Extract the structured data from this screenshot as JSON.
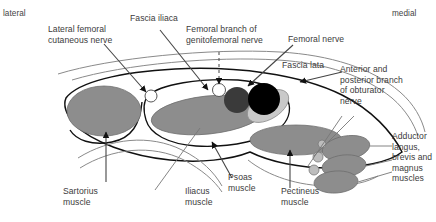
{
  "figure": {
    "type": "anatomical-cross-section",
    "region": "Anterior thigh / femoral triangle transverse section",
    "orientation": {
      "left_label": "lateral",
      "right_label": "medial"
    },
    "labels": {
      "lateral_femoral_cutaneous_nerve": "Lateral femoral\ncutaneous nerve",
      "fascia_iliaca": "Fascia iliaca",
      "femoral_branch_genitofemoral": "Femoral branch of\ngenitofemoral nerve",
      "femoral_nerve": "Femoral nerve",
      "fascia_lata": "Fascia lata",
      "obturator_nerve": "Anterior and\nposterior branch\nof obturator\nnerve",
      "adductor_muscles": "Adductor\nlangus,\nbrevis and\nmagnus\nmuscles",
      "sartorius_muscle": "Sartorius\nmuscle",
      "iliacus_muscle": "Iliacus\nmuscle",
      "psoas_muscle": "Psoas\nmuscle",
      "pectineus_muscle": "Pectineus\nmuscle"
    },
    "structures": [
      {
        "name": "sartorius-muscle",
        "shape": "ellipse",
        "fill": "#8d8d8d"
      },
      {
        "name": "iliacus-muscle",
        "shape": "ellipse",
        "fill": "#8d8d8d"
      },
      {
        "name": "psoas-muscle",
        "shape": "ellipse",
        "fill": "#c9c9c9"
      },
      {
        "name": "pectineus-muscle",
        "shape": "ellipse",
        "fill": "#8d8d8d"
      },
      {
        "name": "femoral-artery",
        "shape": "circle",
        "fill": "#3a3a3a"
      },
      {
        "name": "femoral-vein",
        "shape": "circle",
        "fill": "#000000"
      },
      {
        "name": "adductor-longus-muscle",
        "shape": "ellipse",
        "fill": "#8d8d8d"
      },
      {
        "name": "adductor-brevis-muscle",
        "shape": "ellipse",
        "fill": "#8d8d8d"
      },
      {
        "name": "adductor-magnus-muscle",
        "shape": "ellipse",
        "fill": "#8d8d8d"
      },
      {
        "name": "lateral-femoral-cutaneous-nerve-node",
        "shape": "circle",
        "fill": "#ffffff"
      },
      {
        "name": "femoral-branch-genitofemoral-nerve-node",
        "shape": "circle",
        "fill": "#ffffff"
      },
      {
        "name": "obturator-nerve-node",
        "shape": "circle",
        "fill": "#bdbdbd"
      }
    ],
    "colors": {
      "muscle_gray": "#8d8d8d",
      "psoas_light_gray": "#c9c9c9",
      "artery_dark": "#3a3a3a",
      "vein_black": "#000000",
      "fascia_line": "#111111",
      "leader_line": "#555555",
      "text": "#3b3b3b",
      "background": "#ffffff"
    }
  }
}
